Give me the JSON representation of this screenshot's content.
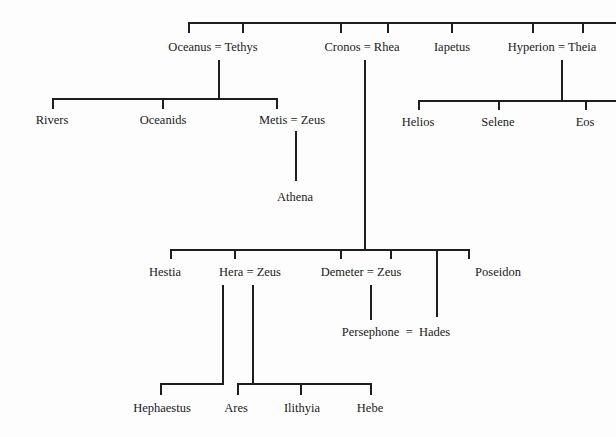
{
  "diagram": {
    "type": "genealogy-tree",
    "generation1": {
      "couples": [
        {
          "id": "oceanus-tethys",
          "label": "Oceanus = Tethys"
        },
        {
          "id": "cronos-rhea",
          "label": "Cronos = Rhea"
        },
        {
          "id": "iapetus",
          "label": "Iapetus"
        },
        {
          "id": "hyperion-theia",
          "label": "Hyperion = Theia"
        }
      ]
    },
    "oceanus_children": [
      {
        "id": "rivers",
        "label": "Rivers"
      },
      {
        "id": "oceanids",
        "label": "Oceanids"
      },
      {
        "id": "metis-zeus",
        "label": "Metis = Zeus"
      }
    ],
    "metis_zeus_children": [
      {
        "id": "athena",
        "label": "Athena"
      }
    ],
    "hyperion_children": [
      {
        "id": "helios",
        "label": "Helios"
      },
      {
        "id": "selene",
        "label": "Selene"
      },
      {
        "id": "eos",
        "label": "Eos"
      }
    ],
    "cronos_children": [
      {
        "id": "hestia",
        "label": "Hestia"
      },
      {
        "id": "hera-zeus",
        "label": "Hera = Zeus"
      },
      {
        "id": "demeter-zeus",
        "label": "Demeter = Zeus"
      },
      {
        "id": "poseidon",
        "label": "Poseidon"
      }
    ],
    "persephone_hades": {
      "id": "persephone-hades",
      "label": "Persephone  =  Hades"
    },
    "hera_children": [
      {
        "id": "hephaestus",
        "label": "Hephaestus"
      },
      {
        "id": "ares",
        "label": "Ares"
      },
      {
        "id": "ilithyia",
        "label": "Ilithyia"
      },
      {
        "id": "hebe",
        "label": "Hebe"
      }
    ]
  }
}
